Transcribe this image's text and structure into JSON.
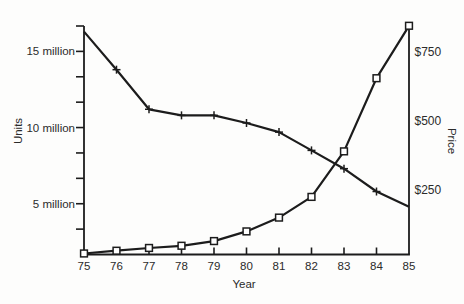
{
  "figure": {
    "title": "",
    "xlabel": "Year",
    "left_ylabel": "Units",
    "right_ylabel": "Price"
  },
  "chart_data": {
    "type": "line",
    "x_tick_labels": [
      "75",
      "76",
      "77",
      "78",
      "79",
      "80",
      "81",
      "82",
      "83",
      "84",
      "85"
    ],
    "xlabel": "Year",
    "grid": false,
    "legend": null,
    "series": [
      {
        "name": "Units",
        "axis": "left",
        "marker": "plus",
        "unit": "million units",
        "values": [
          16.3,
          13.8,
          11.2,
          10.8,
          10.8,
          10.3,
          9.7,
          8.5,
          7.3,
          5.8,
          4.8
        ],
        "marker_indices": [
          1,
          2,
          3,
          4,
          5,
          6,
          7,
          8,
          9
        ]
      },
      {
        "name": "Price",
        "axis": "right",
        "marker": "open-square",
        "unit": "USD",
        "values": [
          20,
          30,
          40,
          48,
          65,
          100,
          150,
          225,
          390,
          655,
          845
        ],
        "marker_indices": [
          0,
          1,
          2,
          3,
          4,
          5,
          6,
          7,
          8,
          9,
          10
        ]
      }
    ],
    "left_axis": {
      "label": "Units",
      "tick_labels": [
        "5 million",
        "10 million",
        "15 million"
      ],
      "tick_values": [
        5,
        10,
        15
      ],
      "minor_tick_step": 1.667,
      "range": [
        1.67,
        16.67
      ]
    },
    "right_axis": {
      "label": "Price",
      "tick_labels": [
        "$250",
        "$500",
        "$750"
      ],
      "tick_values": [
        250,
        500,
        750
      ]
    }
  },
  "colors": {
    "line": "#1c1c1c",
    "text": "#2b2b2b",
    "background": "#fdfdfc"
  }
}
